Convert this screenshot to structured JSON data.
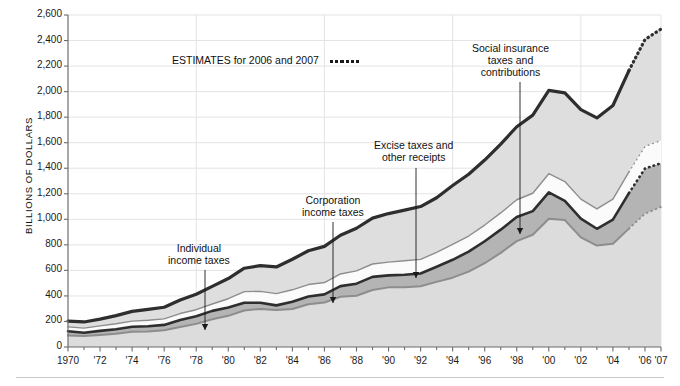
{
  "axis": {
    "y_title": "BILLIONS OF DOLLARS",
    "y_ticks": [
      "0",
      "200",
      "400",
      "600",
      "800",
      "1,000",
      "1,200",
      "1,400",
      "1,600",
      "1,800",
      "2,000",
      "2,200",
      "2,400",
      "2,600"
    ],
    "x_ticks": [
      "1970",
      "'72",
      "'74",
      "'76",
      "'78",
      "'80",
      "'82",
      "'84",
      "'86",
      "'88",
      "'90",
      "'92",
      "'94",
      "'96",
      "'98",
      "'00",
      "'02",
      "'04",
      "'06",
      "'07"
    ]
  },
  "legend": {
    "estimates_label": "ESTIMATES for 2006 and 2007"
  },
  "annotations": {
    "individual": "Individual\nincome taxes",
    "individual_l1": "Individual",
    "individual_l2": "income taxes",
    "corporation_l1": "Corporation",
    "corporation_l2": "income taxes",
    "excise_l1": "Excise taxes and",
    "excise_l2": "other receipts",
    "social_l1": "Social insurance",
    "social_l2": "taxes and",
    "social_l3": "contributions"
  },
  "colors": {
    "band_individual": "#dcdcdc",
    "band_corporation": "#b4b4b4",
    "band_excise": "#fbfbfb",
    "band_social": "#dedede",
    "line_dark": "#2e2e2e",
    "line_mid": "#8d8d8d",
    "gridline": "#e3e3e3",
    "axis": "#6b6b6b"
  },
  "chart_data": {
    "type": "area",
    "title": "",
    "subtitle": "",
    "xlabel": "",
    "ylabel": "BILLIONS OF DOLLARS",
    "ylim": [
      0,
      2600
    ],
    "xlim": [
      1970,
      2007
    ],
    "grid": true,
    "legend_position": "inline-annotations",
    "stacked": true,
    "estimate_years": [
      2006,
      2007
    ],
    "x": [
      1970,
      1971,
      1972,
      1973,
      1974,
      1975,
      1976,
      1977,
      1978,
      1979,
      1980,
      1981,
      1982,
      1983,
      1984,
      1985,
      1986,
      1987,
      1988,
      1989,
      1990,
      1991,
      1992,
      1993,
      1994,
      1995,
      1996,
      1997,
      1998,
      1999,
      2000,
      2001,
      2002,
      2003,
      2004,
      2005,
      2006,
      2007
    ],
    "series": [
      {
        "name": "Individual income taxes",
        "values": [
          90,
          86,
          94,
          103,
          119,
          122,
          131,
          157,
          181,
          217,
          244,
          286,
          298,
          289,
          298,
          335,
          349,
          393,
          401,
          446,
          467,
          468,
          476,
          510,
          543,
          590,
          656,
          737,
          829,
          879,
          1004,
          994,
          858,
          794,
          809,
          927,
          1044,
          1097
        ]
      },
      {
        "name": "Corporation income taxes",
        "values": [
          33,
          26,
          32,
          36,
          39,
          41,
          42,
          55,
          60,
          66,
          65,
          61,
          49,
          37,
          57,
          61,
          63,
          84,
          95,
          103,
          94,
          98,
          100,
          118,
          140,
          157,
          172,
          182,
          189,
          185,
          207,
          151,
          148,
          132,
          189,
          278,
          354,
          342
        ]
      },
      {
        "name": "Excise taxes and other receipts",
        "values": [
          35,
          36,
          39,
          43,
          45,
          46,
          47,
          50,
          51,
          54,
          69,
          87,
          89,
          92,
          93,
          93,
          93,
          95,
          100,
          101,
          104,
          110,
          110,
          113,
          121,
          122,
          127,
          131,
          135,
          140,
          146,
          151,
          152,
          155,
          160,
          166,
          172,
          178
        ]
      },
      {
        "name": "Social insurance taxes and contributions",
        "values": [
          45,
          48,
          53,
          64,
          76,
          86,
          91,
          106,
          121,
          138,
          158,
          183,
          201,
          209,
          239,
          265,
          283,
          303,
          334,
          359,
          380,
          396,
          414,
          428,
          461,
          484,
          509,
          539,
          572,
          612,
          653,
          694,
          701,
          713,
          733,
          794,
          838,
          873
        ]
      }
    ],
    "totals": [
      193,
      187,
      207,
      231,
      263,
      279,
      298,
      356,
      399,
      463,
      517,
      599,
      618,
      601,
      666,
      734,
      769,
      854,
      909,
      991,
      1032,
      1055,
      1091,
      1154,
      1259,
      1351,
      1453,
      1579,
      1722,
      1827,
      1998,
      1991,
      1853,
      1782,
      1880,
      2154,
      2403,
      2481
    ]
  }
}
